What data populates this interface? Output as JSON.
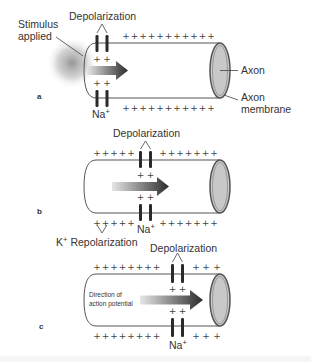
{
  "figure": {
    "panels": [
      {
        "id": "a",
        "panel_label": "a",
        "depolarization_label": "Depolarization",
        "stimulus_label_line1": "Stimulus",
        "stimulus_label_line2": "applied",
        "axon_label": "Axon",
        "membrane_label_line1": "Axon",
        "membrane_label_line2": "membrane",
        "ion_label": "Na",
        "ion_charge": "+"
      },
      {
        "id": "b",
        "panel_label": "b",
        "depolarization_label": "Depolarization",
        "ion_label": "Na",
        "ion_charge": "+",
        "repolarization_ion": "K",
        "repolarization_charge": "+",
        "repolarization_label": "Repolarization"
      },
      {
        "id": "c",
        "panel_label": "c",
        "depolarization_label": "Depolarization",
        "direction_label_line1": "Direction of",
        "direction_label_line2": "action potential",
        "ion_label": "Na",
        "ion_charge": "+"
      }
    ],
    "plus_sign": "+",
    "colors": {
      "line": "#555555",
      "channel": "#2a2a2a",
      "axon_end_fill": "#c8c8c8",
      "arrow_dark": "#2b2b2b",
      "arrow_light": "#e4e4e4",
      "stimulus_glow": "#9a9a9a"
    }
  }
}
